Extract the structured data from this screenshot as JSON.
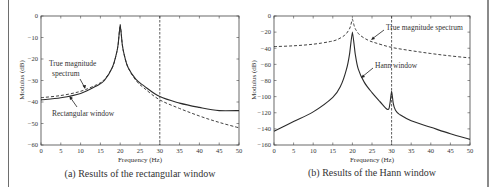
{
  "chart_data": [
    {
      "type": "line",
      "caption": "(a) Results of the rectangular window",
      "xlabel": "Frequency (Hz)",
      "ylabel": "Modulus (dB)",
      "xlim": [
        0,
        50
      ],
      "ylim": [
        -60,
        0
      ],
      "xticks": [
        0,
        5,
        10,
        15,
        20,
        25,
        30,
        35,
        40,
        45,
        50
      ],
      "yticks": [
        0,
        -10,
        -20,
        -30,
        -40,
        -50,
        -60
      ],
      "grid": false,
      "vline_x": 30,
      "series": [
        {
          "name": "True magnitude spectrum",
          "style": "dashed",
          "x": [
            0,
            5,
            10,
            14,
            16,
            18,
            19,
            19.5,
            20,
            20.5,
            21,
            22,
            24,
            26,
            30,
            35,
            40,
            45,
            50
          ],
          "y": [
            -38,
            -37,
            -35,
            -32,
            -29.5,
            -24,
            -18,
            -13,
            -4,
            -13,
            -18,
            -24,
            -30,
            -33.5,
            -39,
            -43,
            -46.5,
            -49.5,
            -52
          ]
        },
        {
          "name": "Rectangular window",
          "style": "solid",
          "x": [
            0,
            5,
            10,
            14,
            16,
            18,
            19,
            19.5,
            20,
            20.5,
            21,
            22,
            24,
            26,
            30,
            35,
            40,
            45,
            50
          ],
          "y": [
            -39,
            -38,
            -36,
            -32.5,
            -30,
            -24,
            -18,
            -13,
            -4,
            -13,
            -18,
            -24,
            -29.5,
            -32.5,
            -37.5,
            -40.5,
            -42.5,
            -44,
            -44
          ]
        }
      ],
      "annotations": [
        {
          "text": "True magnitude spectrum",
          "points_to": "dashed curve near 11 Hz"
        },
        {
          "text": "Rectangular window",
          "points_to": "solid curve near 8 Hz"
        }
      ]
    },
    {
      "type": "line",
      "caption": "(b) Results of the Hann window",
      "xlabel": "Frequency (Hz)",
      "ylabel": "Modulus (dB)",
      "xlim": [
        0,
        50
      ],
      "ylim": [
        -160,
        0
      ],
      "xticks": [
        0,
        5,
        10,
        15,
        20,
        25,
        30,
        35,
        40,
        45,
        50
      ],
      "yticks": [
        0,
        -20,
        -40,
        -60,
        -80,
        -100,
        -120,
        -140,
        -160
      ],
      "grid": false,
      "vline_x": 30,
      "series": [
        {
          "name": "True magnitude spectrum",
          "style": "dashed",
          "x": [
            0,
            5,
            10,
            14,
            16,
            18,
            19,
            19.5,
            20,
            20.5,
            21,
            22,
            24,
            26,
            30,
            35,
            40,
            45,
            50
          ],
          "y": [
            -38,
            -37,
            -35,
            -32,
            -29.5,
            -24,
            -18,
            -13,
            -4,
            -13,
            -18,
            -24,
            -30,
            -33.5,
            -39,
            -43,
            -46.5,
            -49.5,
            -52
          ]
        },
        {
          "name": "Hann window",
          "style": "solid",
          "x": [
            0,
            5,
            10,
            15,
            17,
            18.5,
            19.3,
            20,
            20.7,
            21.5,
            23,
            25,
            27,
            29,
            29.6,
            30,
            30.4,
            31,
            32,
            35,
            40,
            45,
            50
          ],
          "y": [
            -143,
            -131,
            -119,
            -101,
            -87,
            -66,
            -46,
            -20,
            -46,
            -66,
            -82,
            -95,
            -106,
            -116,
            -108,
            -93,
            -108,
            -117,
            -122,
            -130,
            -138,
            -146,
            -153
          ]
        }
      ],
      "annotations": [
        {
          "text": "True magnitude spectrum",
          "points_to": "dashed curve near 25 Hz"
        },
        {
          "text": "Hann window",
          "points_to": "solid curve near 22 Hz"
        }
      ]
    }
  ],
  "panels": {
    "a": {
      "caption": "(a) Results of the rectangular window",
      "xlabel": "Frequency (Hz)",
      "ylabel": "Modulus (dB)",
      "label_true_1": "True magnitude",
      "label_true_2": "spectrum",
      "label_window": "Rectangular window"
    },
    "b": {
      "caption": "(b) Results of the Hann window",
      "xlabel": "Frequency (Hz)",
      "ylabel": "Modulus (dB)",
      "label_true": "True magnitude spectrum",
      "label_window": "Hann window"
    }
  },
  "colors": {
    "line": "#2b2b2b",
    "axis": "#444444",
    "text": "#333333"
  }
}
